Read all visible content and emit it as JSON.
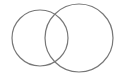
{
  "diagram": {
    "type": "venn",
    "background": "#ffffff",
    "stroke_color": "#777777",
    "stroke_width": 1.2,
    "circles": [
      {
        "name": "left-circle",
        "cx": 40,
        "cy": 38,
        "r": 28
      },
      {
        "name": "right-circle",
        "cx": 79,
        "cy": 38,
        "r": 34
      }
    ]
  }
}
